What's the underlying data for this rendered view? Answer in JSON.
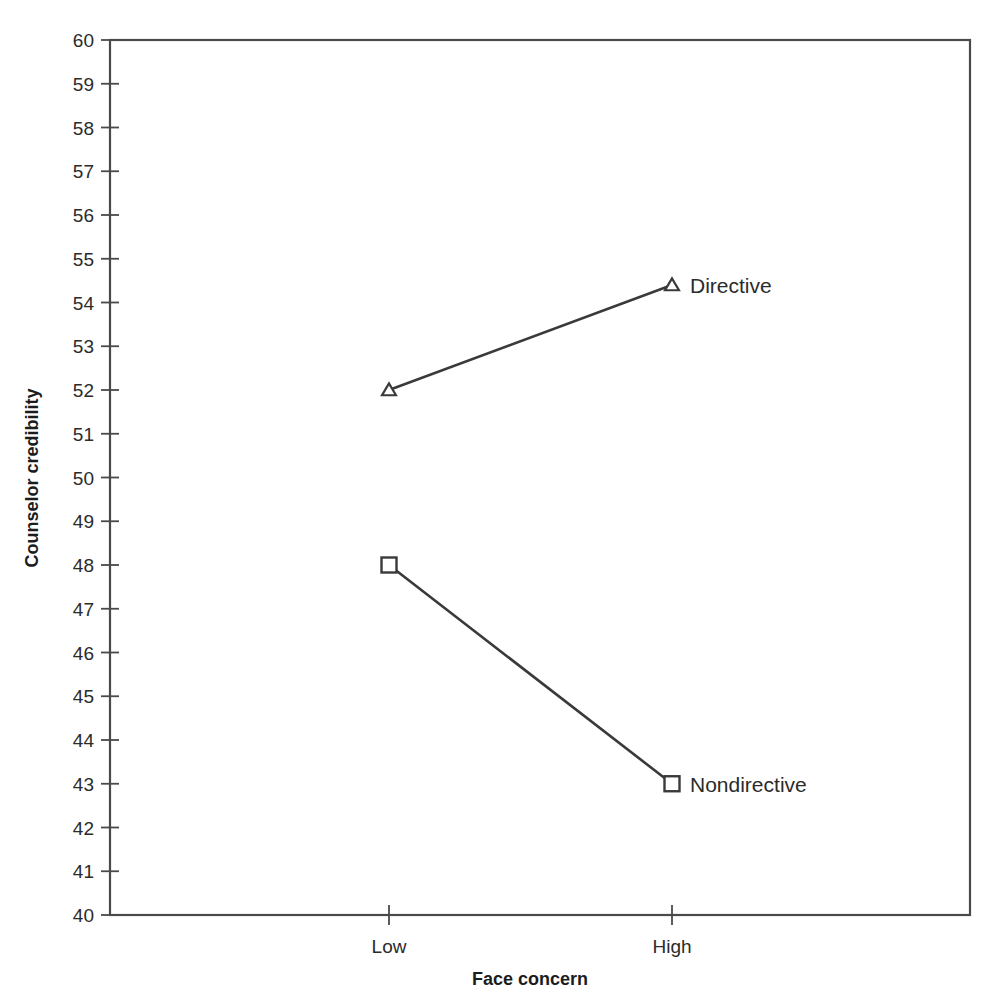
{
  "chart_data": {
    "type": "line",
    "title": "",
    "subtitle": "",
    "xlabel": "Face concern",
    "ylabel": "Counselor credibility",
    "categories": [
      "Low",
      "High"
    ],
    "xtick_labels": [
      "Low",
      "High"
    ],
    "ylim": [
      40,
      60
    ],
    "ytick_labels": [
      "60",
      "59",
      "58",
      "57",
      "56",
      "55",
      "54",
      "53",
      "52",
      "51",
      "50",
      "49",
      "48",
      "47",
      "46",
      "45",
      "44",
      "43",
      "42",
      "41",
      "40"
    ],
    "ytick_values": [
      60,
      59,
      58,
      57,
      56,
      55,
      54,
      53,
      52,
      51,
      50,
      49,
      48,
      47,
      46,
      45,
      44,
      43,
      42,
      41,
      40
    ],
    "grid": false,
    "legend_position": "inline-right-of-last-point",
    "frame": true,
    "series": [
      {
        "name": "Directive",
        "marker": "open-triangle",
        "values": [
          52.0,
          54.4
        ],
        "label_text": "Directive",
        "color": "#3a3a3a"
      },
      {
        "name": "Nondirective",
        "marker": "open-square",
        "values": [
          48.0,
          43.0
        ],
        "label_text": "Nondirective",
        "color": "#3a3a3a"
      }
    ],
    "annotations": [
      {
        "text": "Directive",
        "at_category": "High",
        "at_value": 54.4
      },
      {
        "text": "Nondirective",
        "at_category": "High",
        "at_value": 43.0
      }
    ]
  },
  "axes": {
    "y_title": "Counselor credibility",
    "x_title": "Face concern"
  },
  "colors": {
    "line": "#3a3a3a",
    "frame": "#4a4a4a",
    "text": "#2b2b2b",
    "background": "#ffffff"
  }
}
